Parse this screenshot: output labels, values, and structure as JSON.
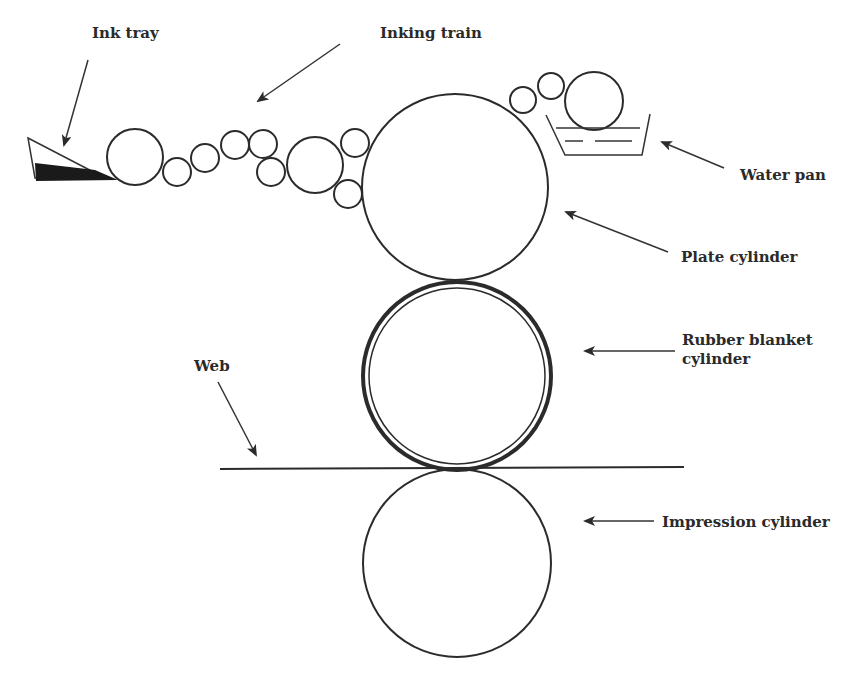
{
  "figure": {
    "labels": {
      "ink_tray": "Ink tray",
      "inking_train": "Inking train",
      "water_pan": "Water pan",
      "plate_cylinder": "Plate cylinder",
      "rubber_blanket_line1": "Rubber blanket",
      "rubber_blanket_line2": "cylinder",
      "web": "Web",
      "impression_cylinder": "Impression cylinder"
    },
    "colors": {
      "line": "#2b2b2b",
      "ink": "#1a1a1a",
      "background": "#ffffff"
    }
  }
}
